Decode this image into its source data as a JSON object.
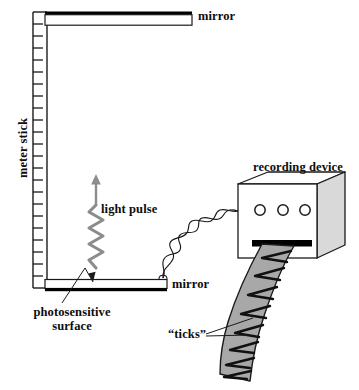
{
  "figure": {
    "type": "physics-diagram",
    "title_visible": false
  },
  "labels": {
    "mirror_top": "mirror",
    "mirror_bottom": "mirror",
    "light_pulse": "light pulse",
    "recording_device": "recording device",
    "ticks": "“ticks”",
    "photosensitive_surface": "photosensitive\nsurface",
    "photosensitive_line1": "photosensitive",
    "photosensitive_line2": "surface",
    "meter_stick": "meter stick"
  },
  "components": {
    "meter_stick": {
      "name": "meter stick",
      "orientation": "vertical",
      "tick_count": 22,
      "top_y": 14,
      "bottom_y": 285
    },
    "mirror_top": {
      "name": "mirror",
      "orientation": "horizontal",
      "position": "top"
    },
    "mirror_bottom": {
      "name": "mirror",
      "orientation": "horizontal",
      "position": "bottom",
      "coating": "photosensitive surface"
    },
    "light_pulse": {
      "name": "light pulse",
      "direction": "upward",
      "rendering": "wavy zigzag with arrowhead"
    },
    "recording_device": {
      "name": "recording device",
      "shape": "3D box",
      "knob_count": 3,
      "has_output_slot": true
    },
    "cable": {
      "name": "twisted cable",
      "connects": [
        "mirror (bottom)",
        "recording device"
      ]
    },
    "tape": {
      "name": "paper tape",
      "tick_count": 9,
      "emerges_from": "recording device slot"
    }
  },
  "colors": {
    "ink": "#0d0d0d",
    "outline": "#1a1a1a",
    "mirror_fill": "#ffffff",
    "mirror_edge": "#000000",
    "device_front": "#ffffff",
    "device_top": "#ffffff",
    "device_side": "#d9d9d9",
    "tape_fill": "#a8a8a8",
    "pulse_gray": "#8c8c8c",
    "slot_black": "#000000",
    "background": "#ffffff"
  }
}
